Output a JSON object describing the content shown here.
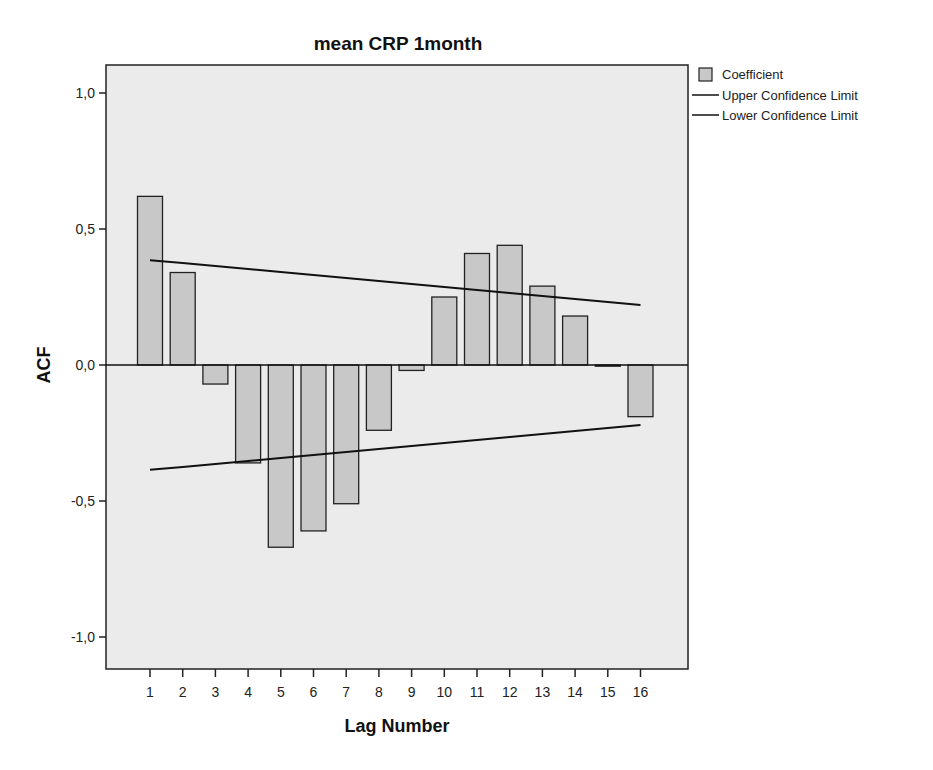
{
  "chart_data": {
    "type": "bar",
    "title": "mean CRP 1month",
    "xlabel": "Lag Number",
    "ylabel": "ACF",
    "ylim": [
      -1.1,
      1.1
    ],
    "yticks": [
      1.0,
      0.5,
      0.0,
      -0.5,
      -1.0
    ],
    "ytick_labels": [
      "1,0",
      "0,5",
      "0,0",
      "-0,5",
      "-1,0"
    ],
    "categories": [
      "1",
      "2",
      "3",
      "4",
      "5",
      "6",
      "7",
      "8",
      "9",
      "10",
      "11",
      "12",
      "13",
      "14",
      "15",
      "16"
    ],
    "series": [
      {
        "name": "Coefficient",
        "kind": "bar",
        "values": [
          0.62,
          0.34,
          -0.07,
          -0.36,
          -0.67,
          -0.61,
          -0.51,
          -0.24,
          -0.02,
          0.25,
          0.41,
          0.44,
          0.29,
          0.18,
          -0.003,
          -0.19
        ]
      },
      {
        "name": "Upper Confidence Limit",
        "kind": "line",
        "values": [
          0.385,
          0.375,
          0.364,
          0.353,
          0.342,
          0.331,
          0.32,
          0.309,
          0.298,
          0.287,
          0.276,
          0.265,
          0.254,
          0.243,
          0.232,
          0.221
        ]
      },
      {
        "name": "Lower Confidence Limit",
        "kind": "line",
        "values": [
          -0.385,
          -0.375,
          -0.364,
          -0.353,
          -0.342,
          -0.331,
          -0.32,
          -0.309,
          -0.298,
          -0.287,
          -0.276,
          -0.265,
          -0.254,
          -0.243,
          -0.232,
          -0.221
        ]
      }
    ],
    "legend": {
      "position": "right-top",
      "entries": [
        "Coefficient",
        "Upper Confidence Limit",
        "Lower Confidence Limit"
      ]
    },
    "grid": false,
    "colors": {
      "bar_fill": "#c8c8c8",
      "bar_stroke": "#222222",
      "plot_bg": "#ebebeb",
      "line": "#111111"
    }
  }
}
